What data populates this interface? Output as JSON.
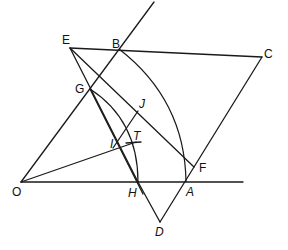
{
  "diagram": {
    "type": "geometric-construction",
    "points": {
      "O": {
        "label": "O",
        "x": 21,
        "y": 182
      },
      "H": {
        "label": "H",
        "x": 138,
        "y": 182
      },
      "A": {
        "label": "A",
        "x": 186,
        "y": 182
      },
      "B": {
        "label": "B",
        "x": 119,
        "y": 49
      },
      "E": {
        "label": "E",
        "x": 70,
        "y": 48
      },
      "C": {
        "label": "C",
        "x": 262,
        "y": 57
      },
      "G": {
        "label": "G",
        "x": 90,
        "y": 89
      },
      "J": {
        "label": "J",
        "x": 138,
        "y": 111
      },
      "I": {
        "label": "I",
        "x": 118,
        "y": 141
      },
      "T": {
        "label": "T",
        "x": 134,
        "y": 143
      },
      "F": {
        "label": "F",
        "x": 194,
        "y": 167
      },
      "D": {
        "label": "D",
        "x": 160,
        "y": 222
      }
    },
    "labels": [
      "E",
      "B",
      "C",
      "G",
      "J",
      "I",
      "T",
      "O",
      "H",
      "A",
      "F",
      "D"
    ]
  }
}
